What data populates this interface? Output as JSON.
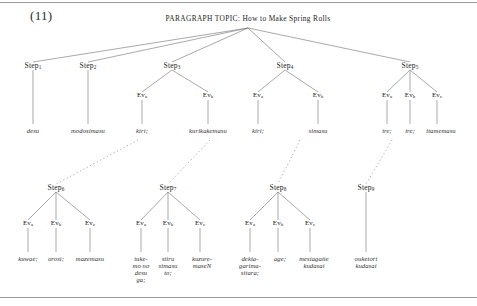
{
  "figure": {
    "example_number": "(11)",
    "root_label": "PARAGRAPH TOPIC: How to Make Spring Rolls",
    "colors": {
      "ink": "#232323",
      "line": "#6f6f6f",
      "rule": "#9a9a9a"
    }
  },
  "steps_tier1": [
    {
      "label": "Step",
      "sub": "1"
    },
    {
      "label": "Step",
      "sub": "2"
    },
    {
      "label": "Step",
      "sub": "3"
    },
    {
      "label": "Step",
      "sub": "4"
    },
    {
      "label": "Step",
      "sub": "5"
    }
  ],
  "events_tier1": [
    {
      "label": "Ev",
      "sub": "a"
    },
    {
      "label": "Ev",
      "sub": "b"
    },
    {
      "label": "Ev",
      "sub": "a"
    },
    {
      "label": "Ev",
      "sub": "b"
    },
    {
      "label": "Ev",
      "sub": "a"
    },
    {
      "label": "Ev",
      "sub": "b"
    },
    {
      "label": "Ev",
      "sub": "c"
    }
  ],
  "terminals_tier1": [
    {
      "lines": [
        "desu"
      ]
    },
    {
      "lines": [
        "modosimasu"
      ]
    },
    {
      "lines": [
        "kiri;"
      ]
    },
    {
      "lines": [
        "kurikakemasu"
      ]
    },
    {
      "lines": [
        "kiri;"
      ]
    },
    {
      "lines": [
        "simasu"
      ]
    },
    {
      "lines": [
        "ire;"
      ]
    },
    {
      "lines": [
        "ire;"
      ]
    },
    {
      "lines": [
        "itamemasu"
      ]
    }
  ],
  "steps_tier2": [
    {
      "label": "Step",
      "sub": "6"
    },
    {
      "label": "Step",
      "sub": "7"
    },
    {
      "label": "Step",
      "sub": "8"
    },
    {
      "label": "Step",
      "sub": "9"
    }
  ],
  "events_tier2": [
    {
      "label": "Ev",
      "sub": "a"
    },
    {
      "label": "Ev",
      "sub": "b"
    },
    {
      "label": "Ev",
      "sub": "c"
    },
    {
      "label": "Ev",
      "sub": "a"
    },
    {
      "label": "Ev",
      "sub": "b"
    },
    {
      "label": "Ev",
      "sub": "c"
    },
    {
      "label": "Ev",
      "sub": "a"
    },
    {
      "label": "Ev",
      "sub": "b"
    },
    {
      "label": "Ev",
      "sub": "c"
    }
  ],
  "terminals_tier2": [
    {
      "lines": [
        "kuwae;"
      ]
    },
    {
      "lines": [
        "orosi;"
      ]
    },
    {
      "lines": [
        "mazemasu"
      ]
    },
    {
      "lines": [
        "tuke-",
        "mo no",
        "desu",
        "ga;"
      ]
    },
    {
      "lines": [
        "siiru",
        "simasu",
        "to;"
      ]
    },
    {
      "lines": [
        "kuzure-",
        "maseN"
      ]
    },
    {
      "lines": [
        "dekia-",
        "garima-",
        "sitara;"
      ]
    },
    {
      "lines": [
        "age;"
      ]
    },
    {
      "lines": [
        "mesiagatte",
        "kudasai"
      ]
    },
    {
      "lines": [
        "ouketori",
        "kudasai"
      ]
    }
  ]
}
